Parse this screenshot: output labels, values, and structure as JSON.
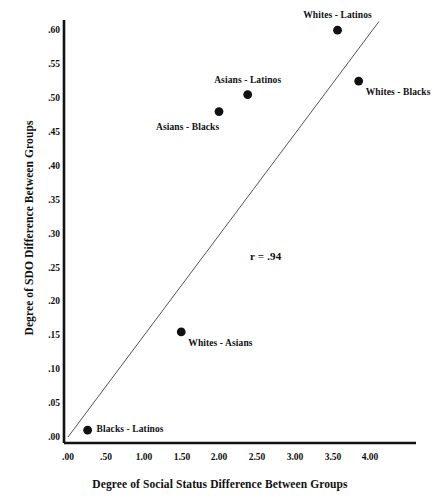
{
  "chart_data": {
    "type": "scatter",
    "title": "",
    "xlabel": "Degree of Social Status Difference Between Groups",
    "ylabel": "Degree of SDO Difference Between Groups",
    "xlim": [
      0.0,
      4.0
    ],
    "ylim": [
      0.0,
      0.6
    ],
    "grid": false,
    "legend": "none",
    "annotations": [
      {
        "text": "r = .94",
        "x": 2.7,
        "y": 0.265
      }
    ],
    "xticks": [
      "'.00'",
      ".50",
      "1.00",
      "1.50",
      "2.00",
      "2.50",
      "3.00",
      "3.50",
      "4.00"
    ],
    "xtick_values": [
      0.0,
      0.5,
      1.0,
      1.5,
      2.0,
      2.5,
      3.0,
      3.5,
      4.0
    ],
    "xtick_labels": [
      ".00",
      ".50",
      "1.00",
      "1.50",
      "2.00",
      "2.50",
      "3.00",
      "3.50",
      "4.00"
    ],
    "ytick_values": [
      0.0,
      0.05,
      0.1,
      0.15,
      0.2,
      0.25,
      0.3,
      0.35,
      0.4,
      0.45,
      0.5,
      0.55,
      0.6
    ],
    "ytick_labels": [
      ".00",
      ".05",
      ".10",
      ".15",
      ".20",
      ".25",
      ".30",
      ".35",
      ".40",
      ".45",
      ".50",
      ".55",
      ".60"
    ],
    "points": [
      {
        "label": "Blacks - Latinos",
        "x": 0.26,
        "y": 0.01,
        "label_pos": "right"
      },
      {
        "label": "Whites - Asians",
        "x": 1.5,
        "y": 0.155,
        "label_pos": "below-right"
      },
      {
        "label": "Asians - Blacks",
        "x": 2.0,
        "y": 0.48,
        "label_pos": "below-left"
      },
      {
        "label": "Asians - Latinos",
        "x": 2.38,
        "y": 0.505,
        "label_pos": "above"
      },
      {
        "label": "Whites - Latinos",
        "x": 3.57,
        "y": 0.6,
        "label_pos": "above"
      },
      {
        "label": "Whites - Blacks",
        "x": 3.85,
        "y": 0.525,
        "label_pos": "below-right"
      }
    ],
    "fit_line": {
      "type": "regression",
      "x_start": 0.0,
      "y_start": 0.0,
      "x_end": 4.12,
      "y_end": 0.613
    },
    "colors": {
      "marker": "#111111",
      "axis": "#111111",
      "fit_line": "#555555",
      "background": "#ffffff",
      "text": "#101010"
    }
  }
}
